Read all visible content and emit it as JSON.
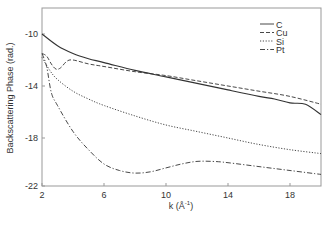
{
  "chart_data": {
    "type": "line",
    "title": "",
    "xlabel": "k (Å⁻¹)",
    "ylabel": "Backscattering Phase (rad.)",
    "xlim": [
      2,
      20
    ],
    "ylim": [
      -22,
      -8.2
    ],
    "xticks": [
      2,
      6,
      10,
      14,
      18
    ],
    "yticks": [
      -10,
      -14,
      -18,
      -22
    ],
    "xtick_labels": [
      "2",
      "6",
      "10",
      "14",
      "18"
    ],
    "ytick_labels": [
      "-10",
      "-14",
      "-18",
      "-22"
    ],
    "grid": false,
    "legend_position": "upper right",
    "series": [
      {
        "name": "C",
        "style": "solid",
        "x": [
          2,
          3,
          4,
          5,
          6,
          8,
          10,
          12,
          14,
          16,
          17,
          18,
          19,
          20
        ],
        "y": [
          -10.0,
          -10.9,
          -11.5,
          -11.9,
          -12.2,
          -12.8,
          -13.3,
          -13.8,
          -14.3,
          -14.8,
          -15.0,
          -15.3,
          -15.4,
          -16.2
        ]
      },
      {
        "name": "Cu",
        "style": "dashed",
        "x": [
          2,
          2.3,
          2.6,
          2.9,
          3.2,
          3.6,
          4,
          5,
          6,
          8,
          10,
          12,
          14,
          16,
          18,
          20
        ],
        "y": [
          -11.5,
          -11.7,
          -12.3,
          -12.7,
          -12.6,
          -12.1,
          -12.0,
          -12.3,
          -12.5,
          -12.9,
          -13.2,
          -13.6,
          -14.0,
          -14.4,
          -14.8,
          -15.4
        ]
      },
      {
        "name": "Si",
        "style": "dotted",
        "x": [
          2,
          2.5,
          3,
          4,
          5,
          6,
          8,
          10,
          12,
          14,
          16,
          18,
          20
        ],
        "y": [
          -11.8,
          -12.8,
          -13.5,
          -14.4,
          -15.0,
          -15.5,
          -16.3,
          -17.0,
          -17.5,
          -18.0,
          -18.5,
          -18.9,
          -19.2
        ]
      },
      {
        "name": "Pt",
        "style": "dash-dot",
        "x": [
          2,
          2.3,
          2.6,
          3,
          4,
          5,
          6,
          7,
          8,
          9,
          10,
          11,
          12,
          13,
          14,
          16,
          18,
          20
        ],
        "y": [
          -11.5,
          -12.5,
          -14.5,
          -15.5,
          -17.5,
          -18.9,
          -20.0,
          -20.5,
          -20.7,
          -20.6,
          -20.3,
          -20.0,
          -19.8,
          -19.8,
          -19.9,
          -20.2,
          -20.5,
          -20.8
        ]
      }
    ]
  },
  "axes": {
    "xlabel_main": "k (Å",
    "xlabel_sup": "-1",
    "xlabel_close": ")",
    "ylabel": "Backscattering Phase (rad.)"
  },
  "legend": {
    "items": [
      {
        "label": "C",
        "style": "solid"
      },
      {
        "label": "Cu",
        "style": "dashed"
      },
      {
        "label": "Si",
        "style": "dotted"
      },
      {
        "label": "Pt",
        "style": "dash-dot"
      }
    ]
  },
  "colors": {
    "line": "#333333",
    "axis": "#888888",
    "text": "#333333"
  }
}
